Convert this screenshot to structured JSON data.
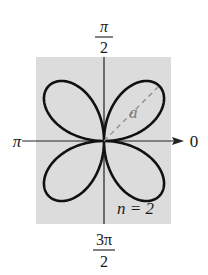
{
  "figure": {
    "type": "polar-rose-graph",
    "equation_family": "rose curve",
    "n_label": "n = 2",
    "petal_label": "a",
    "petal_count": 4,
    "colors": {
      "background_panel": "#dcdcdc",
      "curve": "#111111",
      "axis": "#222222",
      "dashed_radius": "#8a8a8a",
      "petal_label": "#7a7a7a"
    }
  },
  "axes": {
    "top_label": {
      "numerator": "π",
      "denominator": "2"
    },
    "bottom_label": {
      "numerator": "3π",
      "denominator": "2"
    },
    "left_label": "π",
    "right_label": "0"
  }
}
